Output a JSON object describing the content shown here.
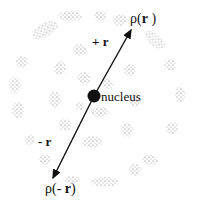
{
  "diagram": {
    "labels": {
      "rho_plus": "ρ(",
      "r_plus": "r",
      "rho_plus_close": " )",
      "plus_r": "+ r",
      "nucleus": "nucleus",
      "minus_r": "- r",
      "rho_minus": "ρ(- ",
      "r_minus": "r",
      "rho_minus_close": ")"
    },
    "colors": {
      "ink": "#111111",
      "dots": "#555555",
      "background": "#ffffff"
    },
    "nucleus": {
      "cx": 94,
      "cy": 96,
      "r": 6
    },
    "arrows": [
      {
        "name": "plus-r-arrow",
        "from": [
          94,
          96
        ],
        "to": [
          131,
          30
        ]
      },
      {
        "name": "minus-r-arrow",
        "from": [
          94,
          96
        ],
        "to": [
          52,
          180
        ]
      }
    ],
    "density_shells": [
      {
        "r": 28
      },
      {
        "r": 55
      },
      {
        "r": 82
      }
    ]
  }
}
